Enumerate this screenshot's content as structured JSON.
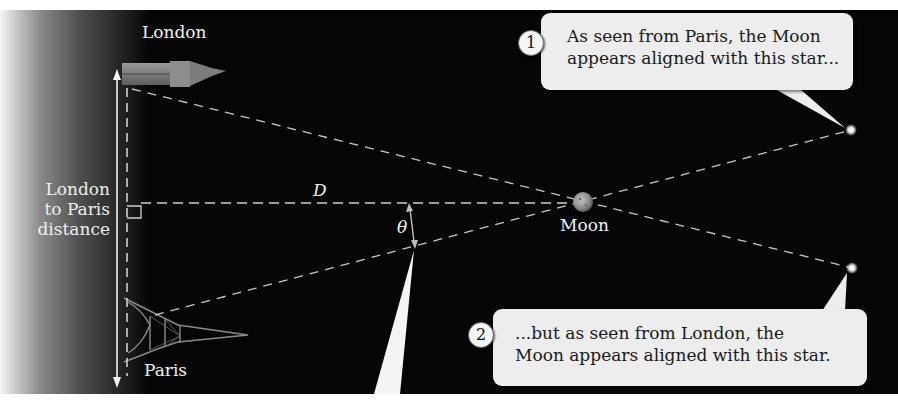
{
  "figure": {
    "labels": {
      "london": "London",
      "paris": "Paris",
      "distance_line1": "London",
      "distance_line2": "to Paris",
      "distance_line3": "distance",
      "distance_symbol": "D",
      "angle_symbol": "θ",
      "moon": "Moon"
    },
    "callouts": [
      {
        "number": "1",
        "line1": "As seen from Paris, the Moon",
        "line2": "appears aligned with this star..."
      },
      {
        "number": "2",
        "line1": "...but as seen from London, the",
        "line2": "Moon appears aligned with this star."
      }
    ],
    "colors": {
      "background": "#050505",
      "callout_fill": "#ededed",
      "dashed_line": "#c8c8c8",
      "text_light": "#f1f1f1"
    }
  }
}
